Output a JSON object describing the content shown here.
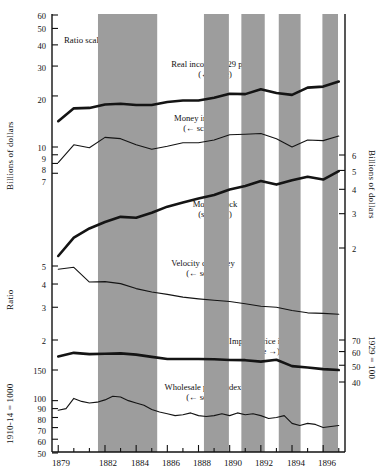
{
  "figure": {
    "note": "Ratio scales",
    "background": "#ffffff",
    "shade_color": "#9d9d9d",
    "line_color": "#141414"
  },
  "axes": {
    "left_top": {
      "title": "Billions of dollars",
      "ticks": [
        "60",
        "50",
        "40",
        "30",
        "20",
        "10",
        "9",
        "8",
        "7"
      ]
    },
    "left_mid": {
      "title": "Ratio",
      "ticks": [
        "5",
        "4",
        "3",
        "2"
      ]
    },
    "left_bottom": {
      "title": "1910-14 = 1000",
      "ticks": [
        "150",
        "100",
        "90",
        "80",
        "70",
        "60",
        "50"
      ]
    },
    "right_top": {
      "title": "Billions of dollars",
      "ticks": [
        "6",
        "5",
        "4",
        "3",
        "2"
      ]
    },
    "right_bottom": {
      "title": "1929 = 100",
      "ticks": [
        "70",
        "60",
        "50",
        "40"
      ]
    },
    "x": {
      "ticks": [
        "1879",
        "1882",
        "1884",
        "1886",
        "1888",
        "1890",
        "1892",
        "1894",
        "1896"
      ]
    }
  },
  "annotations": [
    {
      "name": "real-income",
      "line1": "Real income, 1929 prices",
      "line2": "(← scale)"
    },
    {
      "name": "money-income",
      "line1": "Money income",
      "line2": "(← scale)"
    },
    {
      "name": "money-stock",
      "line1": "Money stock",
      "line2": "(scale →)"
    },
    {
      "name": "velocity",
      "line1": "Velocity of money",
      "line2": "(← scale)"
    },
    {
      "name": "implicit-price-index",
      "line1": "Implicit price index",
      "line2": "(scale →)"
    },
    {
      "name": "wholesale-price-index",
      "line1": "Wholesale price index",
      "line2": "(← scale)"
    }
  ],
  "chart_data": {
    "type": "line",
    "title": "",
    "xlabel": "",
    "ylabel": "Billions of dollars / Ratio / Index",
    "grid": false,
    "legend": "inline-annotations",
    "x_range": [
      1878.6,
      1897.4
    ],
    "x_ticks": [
      1879,
      1880,
      1881,
      1882,
      1883,
      1884,
      1885,
      1886,
      1887,
      1888,
      1889,
      1890,
      1891,
      1892,
      1893,
      1894,
      1895,
      1896,
      1897
    ],
    "x_tick_labels": [
      "1879",
      "",
      "",
      "1882",
      "",
      "1884",
      "",
      "1886",
      "",
      "1888",
      "",
      "1890",
      "",
      "1892",
      "",
      "1894",
      "",
      "1896",
      ""
    ],
    "shaded_recessions": [
      {
        "start": 1881.55,
        "end": 1885.35
      },
      {
        "start": 1888.35,
        "end": 1889.95
      },
      {
        "start": 1890.75,
        "end": 1892.25
      },
      {
        "start": 1893.15,
        "end": 1894.55
      },
      {
        "start": 1895.95,
        "end": 1896.95
      }
    ],
    "series": [
      {
        "name": "Real income, 1929 prices",
        "units": "Billions of dollars",
        "scale": "left-top (log, 7-60)",
        "weight": "thick",
        "x": [
          1879,
          1880,
          1881,
          1882,
          1883,
          1884,
          1885,
          1886,
          1887,
          1888,
          1889,
          1890,
          1891,
          1892,
          1893,
          1894,
          1895,
          1896,
          1897
        ],
        "values": [
          14.2,
          16.9,
          17.0,
          17.8,
          18.0,
          17.7,
          17.7,
          18.4,
          18.8,
          18.8,
          19.5,
          20.6,
          20.5,
          21.9,
          20.8,
          20.3,
          22.4,
          22.7,
          24.3
        ]
      },
      {
        "name": "Money income",
        "units": "Billions of dollars",
        "scale": "left-top (log, 7-60)",
        "weight": "thin",
        "x": [
          1879,
          1880,
          1881,
          1882,
          1883,
          1884,
          1885,
          1886,
          1887,
          1888,
          1889,
          1890,
          1891,
          1892,
          1893,
          1894,
          1895,
          1896,
          1897
        ],
        "values": [
          8.1,
          10.3,
          9.9,
          11.4,
          11.2,
          10.3,
          9.7,
          10.1,
          10.6,
          10.6,
          11.0,
          11.8,
          11.9,
          12.0,
          11.2,
          10.0,
          11.0,
          10.9,
          11.6
        ]
      },
      {
        "name": "Money stock",
        "units": "Billions of dollars",
        "scale": "right-top (log, 2-6)",
        "weight": "thick",
        "x": [
          1879,
          1880,
          1881,
          1882,
          1883,
          1884,
          1885,
          1886,
          1887,
          1888,
          1889,
          1890,
          1891,
          1892,
          1893,
          1894,
          1895,
          1896,
          1897
        ],
        "values": [
          1.82,
          2.26,
          2.52,
          2.72,
          2.89,
          2.86,
          3.03,
          3.26,
          3.42,
          3.59,
          3.74,
          3.99,
          4.16,
          4.41,
          4.23,
          4.45,
          4.64,
          4.49,
          4.96
        ]
      },
      {
        "name": "Velocity of money",
        "units": "Ratio",
        "scale": "left-mid (log, 2-5)",
        "weight": "thin",
        "x": [
          1879,
          1880,
          1881,
          1882,
          1883,
          1884,
          1885,
          1886,
          1887,
          1888,
          1889,
          1890,
          1891,
          1892,
          1893,
          1894,
          1895,
          1896,
          1897
        ],
        "values": [
          4.8,
          4.92,
          4.1,
          4.12,
          4.02,
          3.78,
          3.62,
          3.52,
          3.4,
          3.33,
          3.27,
          3.22,
          3.13,
          3.04,
          3.0,
          2.88,
          2.8,
          2.78,
          2.75
        ]
      },
      {
        "name": "Implicit price index",
        "units": "1929 = 100",
        "scale": "right-bottom (log, 40-70)",
        "weight": "thick",
        "x": [
          1879,
          1880,
          1881,
          1882,
          1883,
          1884,
          1885,
          1886,
          1887,
          1888,
          1889,
          1890,
          1891,
          1892,
          1893,
          1894,
          1895,
          1896,
          1897
        ],
        "values": [
          56.2,
          59.0,
          58.0,
          58.3,
          58.6,
          57.6,
          55.9,
          54.3,
          54.3,
          54.3,
          54.2,
          53.6,
          53.5,
          52.5,
          53.8,
          49.4,
          48.5,
          47.5,
          46.9
        ]
      },
      {
        "name": "Wholesale price index",
        "units": "1910-14 = 1000",
        "scale": "left-bottom (log, 50-150+)",
        "weight": "thin",
        "x": [
          1879.0,
          1879.5,
          1880.0,
          1880.5,
          1881.0,
          1881.5,
          1882.0,
          1882.5,
          1883.0,
          1883.5,
          1884.0,
          1884.5,
          1885.0,
          1885.5,
          1886.0,
          1886.5,
          1887.0,
          1887.5,
          1888.0,
          1888.5,
          1889.0,
          1889.5,
          1890.0,
          1890.5,
          1891.0,
          1891.5,
          1892.0,
          1892.5,
          1893.0,
          1893.5,
          1894.0,
          1894.5,
          1895.0,
          1895.5,
          1896.0,
          1896.5,
          1897.0
        ],
        "values": [
          88,
          90,
          103,
          99,
          97,
          98,
          101,
          106,
          105,
          100,
          97,
          94,
          89,
          86,
          84,
          82,
          83,
          85,
          82,
          81,
          82,
          84,
          82,
          85,
          83,
          84,
          82,
          79,
          80,
          82,
          74,
          72,
          74,
          73,
          70,
          71,
          72
        ]
      }
    ]
  }
}
